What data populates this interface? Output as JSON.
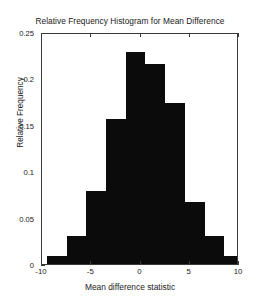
{
  "chart_data": {
    "type": "bar",
    "title": "Relative Frequency Histogram for Mean Difference",
    "xlabel": "Mean difference statistic",
    "ylabel": "Relative Frequency",
    "xlim": [
      -10,
      10
    ],
    "ylim": [
      0,
      0.25
    ],
    "grid": false,
    "legend": null,
    "xticks": [
      "-10",
      "-5",
      "0",
      "5",
      "10"
    ],
    "xtick_values": [
      -10,
      -5,
      0,
      5,
      10
    ],
    "yticks": [
      "0",
      "0.05",
      "0.1",
      "0.15",
      "0.2",
      "0.25"
    ],
    "ytick_values": [
      0,
      0.05,
      0.1,
      0.15,
      0.2,
      0.25
    ],
    "bin_edges": [
      -9.5,
      -7.5,
      -5.5,
      -3.5,
      -1.5,
      0.5,
      2.5,
      4.5,
      6.5,
      8.5,
      9.8
    ],
    "categories": [
      "-9.5 to -7.5",
      "-7.5 to -5.5",
      "-5.5 to -3.5",
      "-3.5 to -1.5",
      "-1.5 to 0.5",
      "0.5 to 2.5",
      "2.5 to 4.5",
      "4.5 to 6.5",
      "6.5 to 8.5",
      "8.5 to 9.8"
    ],
    "values": [
      0.009,
      0.03,
      0.079,
      0.156,
      0.228,
      0.215,
      0.174,
      0.067,
      0.03,
      0.009
    ],
    "bar_color": "#0b0b0b",
    "axis_color": "#3a3a3a",
    "background_color": "#ffffff"
  }
}
